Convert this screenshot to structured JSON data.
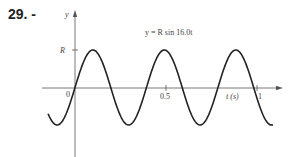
{
  "problem": {
    "number": "29. -"
  },
  "chart_data": {
    "type": "line",
    "title": "y = R sin 16.0t",
    "xlabel": "t (s)",
    "ylabel": "y",
    "x_ticks": [
      {
        "value": 0,
        "label": "0"
      },
      {
        "value": 0.5,
        "label": "0.5"
      },
      {
        "value": 1,
        "label": "1"
      }
    ],
    "y_ticks": [
      {
        "value": 1,
        "label": "R"
      }
    ],
    "series": [
      {
        "name": "y = R sin 16.0t",
        "function": "R*sin(16.0*t)",
        "amplitude": "R",
        "angular_frequency": 16.0,
        "t_range": [
          -0.148,
          1.088
        ]
      }
    ],
    "xlim": [
      -0.18,
      1.14
    ],
    "ylim": [
      -1.5,
      1.45
    ],
    "grid": false,
    "legend": "none"
  },
  "labels": {
    "y_axis": "y",
    "r_tick": "R",
    "origin": "0",
    "half": "0.5",
    "one": "1",
    "t_axis": "t (s)",
    "equation": "y = R sin 16.0t"
  }
}
